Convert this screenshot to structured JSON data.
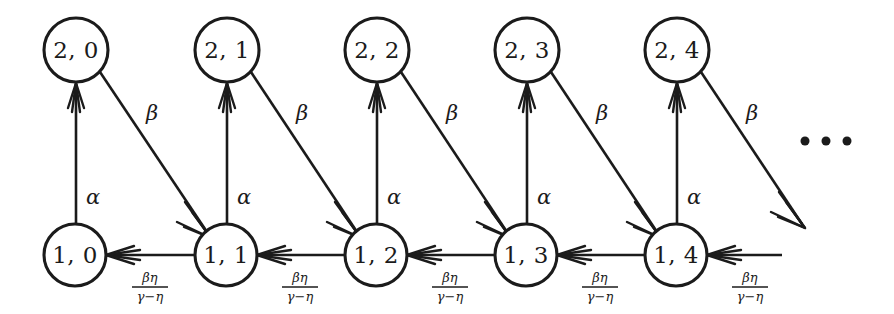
{
  "diagram": {
    "background_color": "#ffffff",
    "stroke_color": "#1b1b1b",
    "nodes": [
      {
        "id": "n20",
        "label": "2, 0",
        "cx": 76,
        "cy": 50,
        "r": 32,
        "row": 2,
        "col": 0
      },
      {
        "id": "n21",
        "label": "2, 1",
        "cx": 227,
        "cy": 50,
        "r": 32,
        "row": 2,
        "col": 1
      },
      {
        "id": "n22",
        "label": "2, 2",
        "cx": 377,
        "cy": 50,
        "r": 32,
        "row": 2,
        "col": 2
      },
      {
        "id": "n23",
        "label": "2, 3",
        "cx": 527,
        "cy": 50,
        "r": 32,
        "row": 2,
        "col": 3
      },
      {
        "id": "n24",
        "label": "2, 4",
        "cx": 677,
        "cy": 50,
        "r": 32,
        "row": 2,
        "col": 4
      },
      {
        "id": "n10",
        "label": "1, 0",
        "cx": 75,
        "cy": 255,
        "r": 31,
        "row": 1,
        "col": 0
      },
      {
        "id": "n11",
        "label": "1, 1",
        "cx": 226,
        "cy": 255,
        "r": 31,
        "row": 1,
        "col": 1
      },
      {
        "id": "n12",
        "label": "1, 2",
        "cx": 376,
        "cy": 255,
        "r": 31,
        "row": 1,
        "col": 2
      },
      {
        "id": "n13",
        "label": "1, 3",
        "cx": 526,
        "cy": 255,
        "r": 31,
        "row": 1,
        "col": 3
      },
      {
        "id": "n14",
        "label": "1, 4",
        "cx": 676,
        "cy": 255,
        "r": 31,
        "row": 1,
        "col": 4
      }
    ],
    "alpha_edges": [
      {
        "from": "n10",
        "to": "n20",
        "label": "α",
        "lx": 93,
        "ly": 198
      },
      {
        "from": "n11",
        "to": "n21",
        "label": "α",
        "lx": 244,
        "ly": 198
      },
      {
        "from": "n12",
        "to": "n22",
        "label": "α",
        "lx": 394,
        "ly": 198
      },
      {
        "from": "n13",
        "to": "n23",
        "label": "α",
        "lx": 544,
        "ly": 198
      },
      {
        "from": "n14",
        "to": "n24",
        "label": "α",
        "lx": 694,
        "ly": 198
      }
    ],
    "beta_edges": [
      {
        "from": "n20",
        "to": "n11",
        "label": "β",
        "lx": 152,
        "ly": 114
      },
      {
        "from": "n21",
        "to": "n12",
        "label": "β",
        "lx": 302,
        "ly": 114
      },
      {
        "from": "n22",
        "to": "n13",
        "label": "β",
        "lx": 452,
        "ly": 114
      },
      {
        "from": "n23",
        "to": "n14",
        "label": "β",
        "lx": 602,
        "ly": 114
      },
      {
        "from": "n24",
        "to": "offscreen",
        "label": "β",
        "lx": 752,
        "ly": 114
      }
    ],
    "horizontal_edges": [
      {
        "from": "n11",
        "to": "n10",
        "numerator": "βη",
        "denominator": "γ−η",
        "lx": 150,
        "ly": 284
      },
      {
        "from": "n12",
        "to": "n11",
        "numerator": "βη",
        "denominator": "γ−η",
        "lx": 300,
        "ly": 284
      },
      {
        "from": "n13",
        "to": "n12",
        "numerator": "βη",
        "denominator": "γ−η",
        "lx": 450,
        "ly": 284
      },
      {
        "from": "n14",
        "to": "n13",
        "numerator": "βη",
        "denominator": "γ−η",
        "lx": 600,
        "ly": 284
      },
      {
        "from": "offscreen",
        "to": "n14",
        "numerator": "βη",
        "denominator": "γ−η",
        "lx": 750,
        "ly": 284
      }
    ],
    "ellipsis": {
      "label": "• • •",
      "dots": [
        {
          "cx": 805,
          "cy": 141,
          "r": 4.5
        },
        {
          "cx": 826,
          "cy": 141,
          "r": 4.5
        },
        {
          "cx": 847,
          "cy": 141,
          "r": 4.5
        }
      ]
    },
    "symbols": {
      "alpha": "α",
      "beta": "β",
      "eta": "η",
      "gamma": "γ",
      "minus": "−"
    }
  }
}
